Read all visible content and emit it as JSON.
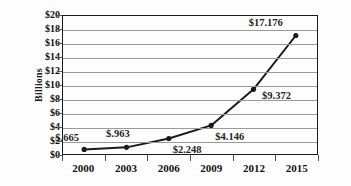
{
  "chart_data": {
    "type": "line",
    "title": "",
    "xlabel": "",
    "ylabel": "Billions",
    "categories": [
      "2000",
      "2003",
      "2006",
      "2009",
      "2012",
      "2015"
    ],
    "values": [
      0.665,
      0.963,
      2.248,
      4.146,
      9.372,
      17.176
    ],
    "point_labels": [
      "$.665",
      "$.963",
      "$2.248",
      "$4.146",
      "$9.372",
      "$17.176"
    ],
    "ylim": [
      0,
      20
    ],
    "ytick_step": 2,
    "ytick_labels": [
      "$0",
      "$2",
      "$4",
      "$6",
      "$8",
      "$10",
      "$12",
      "$14",
      "$16",
      "$18",
      "$20"
    ],
    "ytick_values": [
      0,
      2,
      4,
      6,
      8,
      10,
      12,
      14,
      16,
      18,
      20
    ],
    "grid": true,
    "legend": false,
    "series_color": "#1a1a1a",
    "grid_color": "#9a9a9a",
    "axis_color": "#1b1b1b",
    "marker": "circle"
  },
  "label_offsets": [
    {
      "dx": -28,
      "dy": -17
    },
    {
      "dx": -20,
      "dy": -19
    },
    {
      "dx": 4,
      "dy": 6
    },
    {
      "dx": 4,
      "dy": 6
    },
    {
      "dx": 8,
      "dy": 2
    },
    {
      "dx": -48,
      "dy": -17
    }
  ]
}
